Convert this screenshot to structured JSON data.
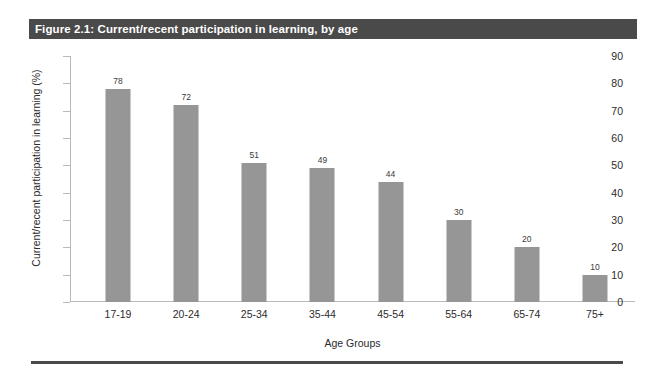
{
  "figure": {
    "header": "Figure 2.1: Current/recent participation in learning, by age"
  },
  "chart_data": {
    "type": "bar",
    "title": "Figure 2.1: Current/recent participation in learning, by age",
    "categories": [
      "17-19",
      "20-24",
      "25-34",
      "35-44",
      "45-54",
      "55-64",
      "65-74",
      "75+"
    ],
    "values": [
      78,
      72,
      51,
      49,
      44,
      30,
      20,
      10
    ],
    "xlabel": "Age Groups",
    "ylabel": "Current/recent participation in learning (%)",
    "ylim": [
      0,
      90
    ],
    "yticks": [
      0,
      10,
      20,
      30,
      40,
      50,
      60,
      70,
      80,
      90
    ],
    "ytick_labels": [
      "0",
      "10",
      "20",
      "30",
      "40",
      "50",
      "60",
      "70",
      "80",
      "90"
    ],
    "grid": false,
    "legend": null,
    "bar_color": "#969696",
    "data_labels": [
      "78",
      "72",
      "51",
      "49",
      "44",
      "30",
      "20",
      "10"
    ]
  }
}
